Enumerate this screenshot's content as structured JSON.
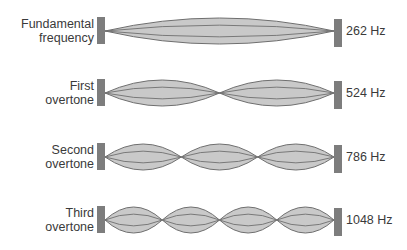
{
  "colors": {
    "bar": "#7d7d7d",
    "lobe_fill": "#c9c9c9",
    "lobe_stroke": "#6f6f6f",
    "text": "#3a3a3a"
  },
  "rows": [
    {
      "label_line1": "Fundamental",
      "label_line2": "frequency",
      "frequency": "262 Hz",
      "loops": 1,
      "center_y": 31,
      "amplitude": 13
    },
    {
      "label_line1": "First",
      "label_line2": "overtone",
      "frequency": "524 Hz",
      "loops": 2,
      "center_y": 93,
      "amplitude": 13
    },
    {
      "label_line1": "Second",
      "label_line2": "overtone",
      "frequency": "786 Hz",
      "loops": 3,
      "center_y": 157,
      "amplitude": 13
    },
    {
      "label_line1": "Third",
      "label_line2": "overtone",
      "frequency": "1048 Hz",
      "loops": 4,
      "center_y": 220,
      "amplitude": 13
    }
  ]
}
